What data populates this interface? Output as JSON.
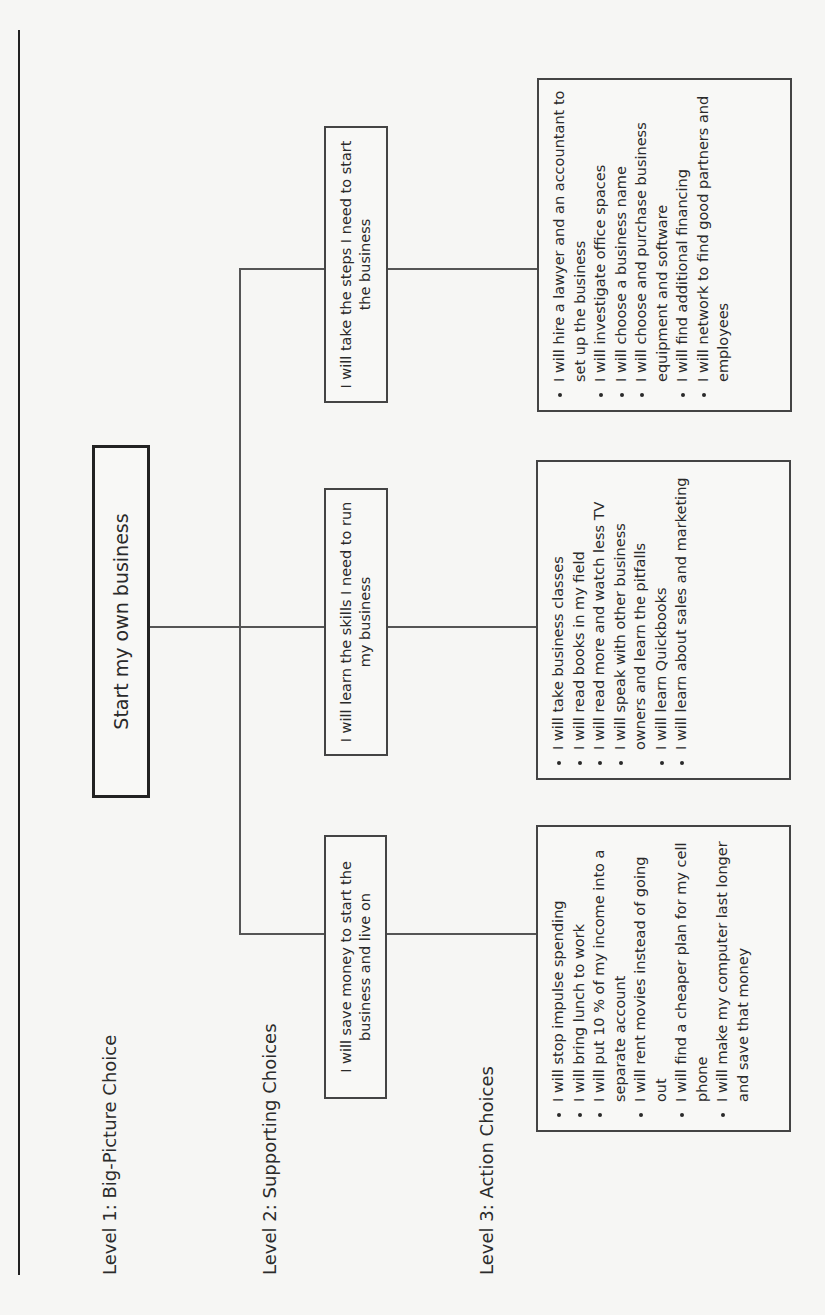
{
  "levels": {
    "level1": "Level 1: Big-Picture Choice",
    "level2": "Level 2: Supporting Choices",
    "level3": "Level 3: Action Choices"
  },
  "big_picture": "Start my own business",
  "supporting": [
    {
      "label": "I will save money to start the business and live on",
      "actions": [
        "I will stop impulse spending",
        "I will bring lunch to work",
        "I will put 10 % of my income into a separate account",
        "I will rent movies instead of going out",
        "I will find a cheaper plan for my cell phone",
        "I will make my computer last longer and save that money"
      ]
    },
    {
      "label": "I will learn the skills I need to run my business",
      "actions": [
        "I will take business classes",
        "I will read books in my field",
        "I will read more and watch less TV",
        "I will speak with other business owners and learn the pitfalls",
        "I will learn Quickbooks",
        "I will learn about sales and marketing"
      ]
    },
    {
      "label": "I will take the steps I need to start the business",
      "actions": [
        "I will hire a lawyer and an accountant to set up the business",
        "I will investigate office spaces",
        "I will choose a business name",
        "I will choose and purchase business equipment and software",
        "I will find additional financing",
        "I will network to find good partners and employees"
      ]
    }
  ]
}
